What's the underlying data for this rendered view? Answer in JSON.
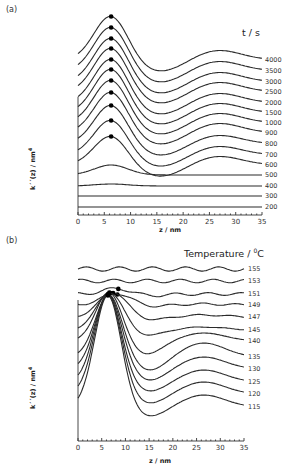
{
  "figure": {
    "panels": [
      {
        "label": "(a)",
        "legend_title": "t / s",
        "xlabel": "z / nm",
        "ylabel_main": "k´´(z) / nm",
        "ylabel_sup": "4",
        "xticks": [
          "0",
          "5",
          "10",
          "15",
          "20",
          "25",
          "30",
          "35"
        ]
      },
      {
        "label": "(b)",
        "legend_title_main": "Temperature / ",
        "legend_title_sup": "0",
        "legend_title_end": "C",
        "xlabel": "z / nm",
        "ylabel_main": "k´´(z) / nm",
        "ylabel_sup": "4",
        "xticks": [
          "0",
          "5",
          "10",
          "15",
          "20",
          "25",
          "30",
          "35"
        ]
      }
    ]
  },
  "chart_data": [
    {
      "type": "line",
      "title": "(a)",
      "subtitle": "t / s",
      "xlabel": "z / nm",
      "ylabel": "k''(z) / nm^4 (curves vertically offset)",
      "xlim": [
        0,
        35
      ],
      "grid": false,
      "legend_position": "right (curve end labels)",
      "series_labels": [
        "4000",
        "3500",
        "3000",
        "2500",
        "2000",
        "1500",
        "1000",
        "900",
        "800",
        "700",
        "600",
        "500",
        "400",
        "300",
        "200"
      ],
      "series": [
        {
          "name": "4000",
          "peak_z": 6.3,
          "peak_marked": true,
          "second_max_z": 26
        },
        {
          "name": "3500",
          "peak_z": 6.3,
          "peak_marked": true,
          "second_max_z": 26
        },
        {
          "name": "3000",
          "peak_z": 6.3,
          "peak_marked": true,
          "second_max_z": 26
        },
        {
          "name": "2500",
          "peak_z": 6.3,
          "peak_marked": true,
          "second_max_z": 26
        },
        {
          "name": "2000",
          "peak_z": 6.3,
          "peak_marked": true,
          "second_max_z": 26
        },
        {
          "name": "1500",
          "peak_z": 6.3,
          "peak_marked": true,
          "second_max_z": 26
        },
        {
          "name": "1000",
          "peak_z": 6.3,
          "peak_marked": true,
          "second_max_z": 26
        },
        {
          "name": "900",
          "peak_z": 6.3,
          "peak_marked": true,
          "second_max_z": 26
        },
        {
          "name": "800",
          "peak_z": 6.3,
          "peak_marked": true,
          "second_max_z": 27
        },
        {
          "name": "700",
          "peak_z": 6.3,
          "peak_marked": true,
          "second_max_z": 27
        },
        {
          "name": "600",
          "peak_z": 6.3,
          "peak_marked": true,
          "second_max_z": 27
        },
        {
          "name": "500",
          "peak_z": 6,
          "peak_marked": false
        },
        {
          "name": "400",
          "peak_z": null,
          "peak_marked": false
        },
        {
          "name": "300",
          "peak_z": null,
          "peak_marked": false
        },
        {
          "name": "200",
          "peak_z": null,
          "peak_marked": false
        }
      ]
    },
    {
      "type": "line",
      "title": "(b)",
      "subtitle": "Temperature / °C",
      "xlabel": "z / nm",
      "ylabel": "k''(z) / nm^4 (curves vertically offset)",
      "xlim": [
        0,
        35
      ],
      "grid": false,
      "legend_position": "right (curve end labels)",
      "series_labels": [
        "155",
        "153",
        "151",
        "149",
        "147",
        "145",
        "140",
        "135",
        "130",
        "125",
        "120",
        "115"
      ],
      "series": [
        {
          "name": "155",
          "peak_z": null,
          "peak_marked": false
        },
        {
          "name": "153",
          "peak_z": null,
          "peak_marked": false
        },
        {
          "name": "151",
          "peak_z": 8.5,
          "peak_marked": true
        },
        {
          "name": "149",
          "peak_z": 8.3,
          "peak_marked": true
        },
        {
          "name": "147",
          "peak_z": 7.4,
          "peak_marked": true
        },
        {
          "name": "145",
          "peak_z": 6.8,
          "peak_marked": true
        },
        {
          "name": "140",
          "peak_z": 6.6,
          "peak_marked": true
        },
        {
          "name": "135",
          "peak_z": 6.5,
          "peak_marked": true
        },
        {
          "name": "130",
          "peak_z": 6.4,
          "peak_marked": true
        },
        {
          "name": "125",
          "peak_z": 6.3,
          "peak_marked": true
        },
        {
          "name": "120",
          "peak_z": 6.3,
          "peak_marked": true
        },
        {
          "name": "115",
          "peak_z": 6.3,
          "peak_marked": true,
          "second_max_z": 26
        }
      ]
    }
  ]
}
